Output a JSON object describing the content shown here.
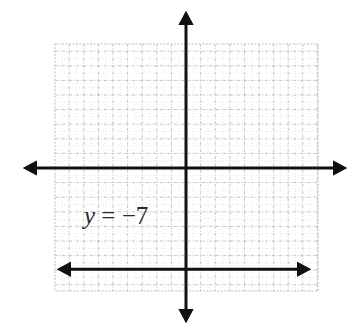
{
  "chart_data": {
    "type": "line",
    "title": "",
    "xlabel": "",
    "ylabel": "",
    "xlim": [
      -9,
      9
    ],
    "ylim": [
      -8.5,
      8.5
    ],
    "grid": true,
    "axes_arrows": true,
    "tick_labels": false,
    "series": [
      {
        "name": "y = -7",
        "equation": "y = -7",
        "x": [
          -8.5,
          8.5
        ],
        "y": [
          -7,
          -7
        ],
        "arrows_both_ends": true
      }
    ],
    "annotations": [
      {
        "text": "y = −7",
        "x": -7,
        "y": -4.5
      }
    ]
  },
  "label": {
    "variable": "y",
    "rest": " = −7"
  },
  "colors": {
    "axis": "#111111",
    "line": "#111111",
    "grid": "#b8b8b8",
    "grid_minor": "#d6d6d6",
    "label": "#2a2a2a"
  }
}
